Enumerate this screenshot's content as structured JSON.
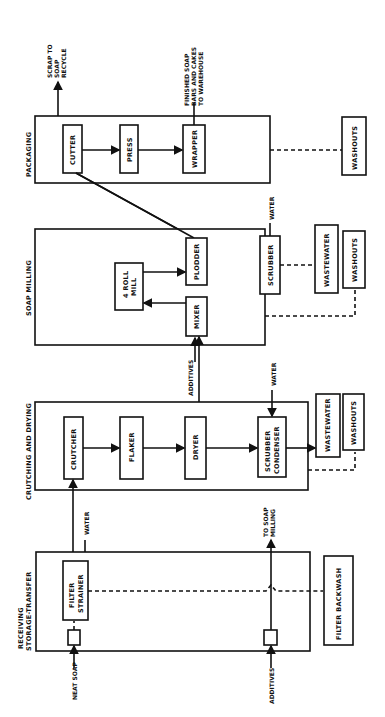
{
  "diagram": {
    "orientation": "rotated 90 degrees counterclockwise",
    "sections": {
      "packaging": "PACKAGING",
      "soap_milling": "SOAP MILLING",
      "crutching_drying": "CRUTCHING AND DRYING",
      "receiving": "RECEIVING",
      "receiving2": "STORAGE-TRANSFER"
    },
    "nodes": {
      "cutter": "CUTTER",
      "press": "PRESS",
      "wrapper": "WRAPPER",
      "washouts_pkg": "WASHOUTS",
      "four_roll_mill_1": "4 ROLL",
      "four_roll_mill_2": "MILL",
      "plodder": "PLODDER",
      "mixer": "MIXER",
      "scrubber_mill": "SCRUBBER",
      "wastewater_mill": "WASTEWATER",
      "washouts_mill": "WASHOUTS",
      "crutcher": "CRUTCHER",
      "flaker": "FLAKER",
      "dryer": "DRYER",
      "scrubber_condenser_1": "SCRUBBER",
      "scrubber_condenser_2": "CONDENSER",
      "wastewater_crutch": "WASTEWATER",
      "washouts_crutch": "WASHOUTS",
      "filter_strainer_1": "FILTER",
      "filter_strainer_2": "STRAINER",
      "filter_backwash": "FILTER BACKWASH"
    },
    "labels": {
      "scrap_1": "SCRAP TO",
      "scrap_2": "SOAP",
      "scrap_3": "RECYCLE",
      "finished_1": "FINISHED SOAP",
      "finished_2": "BARS AND CAKES",
      "finished_3": "TO WAREHOUSE",
      "water_mill": "WATER",
      "additives_mill": "ADDITIVES",
      "water_crutch": "WATER",
      "water_recv": "WATER",
      "to_soap_milling_1": "TO SOAP",
      "to_soap_milling_2": "MILLING",
      "neat_soap": "NEAT SOAP",
      "additives_recv": "ADDITIVES"
    }
  }
}
